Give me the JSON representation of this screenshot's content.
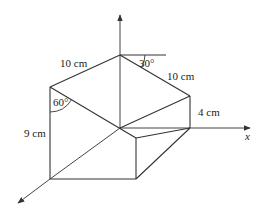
{
  "figure": {
    "type": "3d-prism-diagram",
    "labels": {
      "top_left_edge": "10 cm",
      "top_right_edge": "10 cm",
      "right_height": "4 cm",
      "left_height": "9 cm",
      "angle_top": "30°",
      "angle_left": "60°",
      "x_axis": "x"
    },
    "axes": [
      "x",
      "y (vertical)",
      "z (toward viewer)"
    ],
    "colors": {
      "line": "#333333",
      "background": "#ffffff",
      "text": "#222222"
    }
  }
}
